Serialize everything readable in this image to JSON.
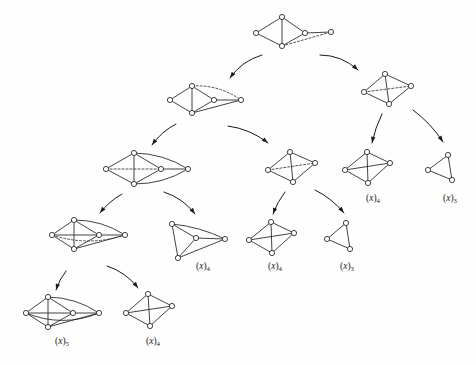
{
  "figure": {
    "width": 476,
    "height": 365,
    "background_color": "#fefefe",
    "ink_color": "#25211e",
    "node_fill": "#ffffff",
    "node_radius": 2.6,
    "bottom_caption": "",
    "graphs": [
      {
        "id": "g-root",
        "name": "root-graph",
        "vertices": 5,
        "label": "",
        "label_base": "",
        "label_sub": "",
        "nodes": [
          {
            "x": 282,
            "y": 17
          },
          {
            "x": 256,
            "y": 33
          },
          {
            "x": 282,
            "y": 46
          },
          {
            "x": 305,
            "y": 33
          },
          {
            "x": 331,
            "y": 32
          }
        ],
        "edges": [
          {
            "from": 0,
            "to": 1,
            "style": "solid"
          },
          {
            "from": 1,
            "to": 2,
            "style": "solid"
          },
          {
            "from": 0,
            "to": 2,
            "style": "solid"
          },
          {
            "from": 0,
            "to": 3,
            "style": "solid"
          },
          {
            "from": 2,
            "to": 3,
            "style": "solid"
          },
          {
            "from": 3,
            "to": 4,
            "style": "solid"
          },
          {
            "from": 2,
            "to": 4,
            "style": "dashed"
          }
        ],
        "arcs": []
      },
      {
        "id": "g-L1",
        "name": "level1-left-graph",
        "vertices": 5,
        "label": "",
        "label_base": "",
        "label_sub": "",
        "nodes": [
          {
            "x": 192,
            "y": 86
          },
          {
            "x": 170,
            "y": 100
          },
          {
            "x": 192,
            "y": 113
          },
          {
            "x": 214,
            "y": 100
          },
          {
            "x": 241,
            "y": 100
          }
        ],
        "edges": [
          {
            "from": 0,
            "to": 1,
            "style": "solid"
          },
          {
            "from": 1,
            "to": 2,
            "style": "solid"
          },
          {
            "from": 0,
            "to": 2,
            "style": "solid"
          },
          {
            "from": 0,
            "to": 3,
            "style": "solid"
          },
          {
            "from": 2,
            "to": 3,
            "style": "solid"
          },
          {
            "from": 3,
            "to": 4,
            "style": "solid"
          },
          {
            "from": 2,
            "to": 4,
            "style": "solid"
          }
        ],
        "arcs": [
          {
            "from": 0,
            "to": 4,
            "bow": -9,
            "style": "dashed"
          }
        ]
      },
      {
        "id": "g-R1",
        "name": "level1-right-graph",
        "vertices": 4,
        "label": "",
        "label_base": "",
        "label_sub": "",
        "nodes": [
          {
            "x": 385,
            "y": 74
          },
          {
            "x": 364,
            "y": 92
          },
          {
            "x": 389,
            "y": 104
          },
          {
            "x": 411,
            "y": 86
          }
        ],
        "edges": [
          {
            "from": 0,
            "to": 1,
            "style": "solid"
          },
          {
            "from": 1,
            "to": 2,
            "style": "solid"
          },
          {
            "from": 2,
            "to": 3,
            "style": "solid"
          },
          {
            "from": 0,
            "to": 3,
            "style": "solid"
          },
          {
            "from": 0,
            "to": 2,
            "style": "solid"
          },
          {
            "from": 1,
            "to": 3,
            "style": "dashed"
          }
        ],
        "arcs": []
      },
      {
        "id": "g-L2",
        "name": "level2-left-graph",
        "vertices": 5,
        "label": "",
        "label_base": "",
        "label_sub": "",
        "nodes": [
          {
            "x": 134,
            "y": 153
          },
          {
            "x": 106,
            "y": 169
          },
          {
            "x": 134,
            "y": 184
          },
          {
            "x": 161,
            "y": 169
          },
          {
            "x": 188,
            "y": 169
          }
        ],
        "edges": [
          {
            "from": 0,
            "to": 1,
            "style": "solid"
          },
          {
            "from": 1,
            "to": 2,
            "style": "solid"
          },
          {
            "from": 0,
            "to": 2,
            "style": "solid"
          },
          {
            "from": 0,
            "to": 3,
            "style": "solid"
          },
          {
            "from": 2,
            "to": 3,
            "style": "solid"
          },
          {
            "from": 3,
            "to": 4,
            "style": "solid"
          },
          {
            "from": 1,
            "to": 3,
            "style": "dashed"
          }
        ],
        "arcs": [
          {
            "from": 0,
            "to": 4,
            "bow": -8,
            "style": "solid"
          },
          {
            "from": 2,
            "to": 4,
            "bow": 8,
            "style": "solid"
          }
        ]
      },
      {
        "id": "g-M2",
        "name": "level2-mid-graph",
        "vertices": 4,
        "label": "",
        "label_base": "",
        "label_sub": "",
        "nodes": [
          {
            "x": 290,
            "y": 152
          },
          {
            "x": 268,
            "y": 170
          },
          {
            "x": 293,
            "y": 182
          },
          {
            "x": 315,
            "y": 163
          }
        ],
        "edges": [
          {
            "from": 0,
            "to": 1,
            "style": "solid"
          },
          {
            "from": 1,
            "to": 2,
            "style": "solid"
          },
          {
            "from": 2,
            "to": 3,
            "style": "solid"
          },
          {
            "from": 0,
            "to": 3,
            "style": "solid"
          },
          {
            "from": 0,
            "to": 2,
            "style": "solid"
          },
          {
            "from": 1,
            "to": 3,
            "style": "dashed"
          }
        ],
        "arcs": []
      },
      {
        "id": "g-R2",
        "name": "level2-k4-graph",
        "vertices": 4,
        "label": "(x)4",
        "label_base": "x",
        "label_sub": "4",
        "label_x": 366,
        "label_y": 201,
        "nodes": [
          {
            "x": 367,
            "y": 152
          },
          {
            "x": 345,
            "y": 170
          },
          {
            "x": 368,
            "y": 183
          },
          {
            "x": 390,
            "y": 163
          }
        ],
        "edges": [
          {
            "from": 0,
            "to": 1,
            "style": "solid"
          },
          {
            "from": 1,
            "to": 2,
            "style": "solid"
          },
          {
            "from": 2,
            "to": 3,
            "style": "solid"
          },
          {
            "from": 0,
            "to": 3,
            "style": "solid"
          },
          {
            "from": 0,
            "to": 2,
            "style": "solid"
          },
          {
            "from": 1,
            "to": 3,
            "style": "solid"
          }
        ],
        "arcs": []
      },
      {
        "id": "g-R3",
        "name": "level2-triangle-graph",
        "vertices": 3,
        "label": "(x)3",
        "label_base": "x",
        "label_sub": "3",
        "label_x": 443,
        "label_y": 201,
        "nodes": [
          {
            "x": 448,
            "y": 155
          },
          {
            "x": 428,
            "y": 170
          },
          {
            "x": 452,
            "y": 180
          }
        ],
        "edges": [
          {
            "from": 0,
            "to": 1,
            "style": "solid"
          },
          {
            "from": 1,
            "to": 2,
            "style": "solid"
          },
          {
            "from": 0,
            "to": 2,
            "style": "solid"
          }
        ],
        "arcs": []
      },
      {
        "id": "g-L3",
        "name": "level3-left-graph",
        "vertices": 5,
        "label": "",
        "label_base": "",
        "label_sub": "",
        "nodes": [
          {
            "x": 74,
            "y": 220
          },
          {
            "x": 52,
            "y": 235
          },
          {
            "x": 74,
            "y": 249
          },
          {
            "x": 99,
            "y": 235
          },
          {
            "x": 125,
            "y": 235
          }
        ],
        "edges": [
          {
            "from": 0,
            "to": 1,
            "style": "solid"
          },
          {
            "from": 1,
            "to": 2,
            "style": "solid"
          },
          {
            "from": 0,
            "to": 2,
            "style": "solid"
          },
          {
            "from": 0,
            "to": 3,
            "style": "solid"
          },
          {
            "from": 2,
            "to": 3,
            "style": "solid"
          },
          {
            "from": 3,
            "to": 4,
            "style": "solid"
          },
          {
            "from": 1,
            "to": 3,
            "style": "solid"
          },
          {
            "from": 2,
            "to": 4,
            "style": "solid"
          }
        ],
        "arcs": [
          {
            "from": 0,
            "to": 4,
            "bow": -8,
            "style": "solid"
          },
          {
            "from": 1,
            "to": 4,
            "bow": 12,
            "style": "dashed"
          }
        ]
      },
      {
        "id": "g-M3",
        "name": "level3-mid-k4-graph",
        "vertices": 4,
        "label": "(x)4",
        "label_base": "x",
        "label_sub": "4",
        "label_x": 196,
        "label_y": 269,
        "nodes": [
          {
            "x": 172,
            "y": 224
          },
          {
            "x": 196,
            "y": 238
          },
          {
            "x": 225,
            "y": 239
          },
          {
            "x": 178,
            "y": 258
          }
        ],
        "edges": [
          {
            "from": 0,
            "to": 1,
            "style": "solid"
          },
          {
            "from": 1,
            "to": 2,
            "style": "solid"
          },
          {
            "from": 0,
            "to": 3,
            "style": "solid"
          },
          {
            "from": 1,
            "to": 3,
            "style": "solid"
          },
          {
            "from": 2,
            "to": 3,
            "style": "solid"
          }
        ],
        "arcs": [
          {
            "from": 0,
            "to": 2,
            "bow": -5,
            "style": "solid"
          }
        ]
      },
      {
        "id": "g-M4",
        "name": "level3-k4-graph",
        "vertices": 4,
        "label": "(x)4",
        "label_base": "x",
        "label_sub": "4",
        "label_x": 268,
        "label_y": 269,
        "nodes": [
          {
            "x": 271,
            "y": 222
          },
          {
            "x": 249,
            "y": 240
          },
          {
            "x": 272,
            "y": 253
          },
          {
            "x": 294,
            "y": 233
          }
        ],
        "edges": [
          {
            "from": 0,
            "to": 1,
            "style": "solid"
          },
          {
            "from": 1,
            "to": 2,
            "style": "solid"
          },
          {
            "from": 2,
            "to": 3,
            "style": "solid"
          },
          {
            "from": 0,
            "to": 3,
            "style": "solid"
          },
          {
            "from": 0,
            "to": 2,
            "style": "solid"
          },
          {
            "from": 1,
            "to": 3,
            "style": "solid"
          }
        ],
        "arcs": []
      },
      {
        "id": "g-M5",
        "name": "level3-triangle-graph",
        "vertices": 3,
        "label": "(x)3",
        "label_base": "x",
        "label_sub": "3",
        "label_x": 340,
        "label_y": 269,
        "nodes": [
          {
            "x": 346,
            "y": 223
          },
          {
            "x": 327,
            "y": 239
          },
          {
            "x": 350,
            "y": 249
          }
        ],
        "edges": [
          {
            "from": 0,
            "to": 1,
            "style": "solid"
          },
          {
            "from": 1,
            "to": 2,
            "style": "solid"
          },
          {
            "from": 0,
            "to": 2,
            "style": "solid"
          }
        ],
        "arcs": []
      },
      {
        "id": "g-B1",
        "name": "bottom-left-graph",
        "vertices": 5,
        "label": "(x)5",
        "label_base": "x",
        "label_sub": "5",
        "label_x": 55,
        "label_y": 344,
        "nodes": [
          {
            "x": 48,
            "y": 297
          },
          {
            "x": 26,
            "y": 313
          },
          {
            "x": 48,
            "y": 327
          },
          {
            "x": 73,
            "y": 313
          },
          {
            "x": 99,
            "y": 313
          }
        ],
        "edges": [
          {
            "from": 0,
            "to": 1,
            "style": "solid"
          },
          {
            "from": 1,
            "to": 2,
            "style": "solid"
          },
          {
            "from": 0,
            "to": 2,
            "style": "solid"
          },
          {
            "from": 0,
            "to": 3,
            "style": "solid"
          },
          {
            "from": 2,
            "to": 3,
            "style": "solid"
          },
          {
            "from": 3,
            "to": 4,
            "style": "solid"
          },
          {
            "from": 1,
            "to": 3,
            "style": "solid"
          },
          {
            "from": 2,
            "to": 4,
            "style": "solid"
          }
        ],
        "arcs": [
          {
            "from": 0,
            "to": 4,
            "bow": -8,
            "style": "solid"
          },
          {
            "from": 1,
            "to": 4,
            "bow": 15,
            "style": "solid"
          }
        ]
      },
      {
        "id": "g-B2",
        "name": "bottom-k4-graph",
        "vertices": 4,
        "label": "(x)4",
        "label_base": "x",
        "label_sub": "4",
        "label_x": 146,
        "label_y": 344,
        "nodes": [
          {
            "x": 148,
            "y": 294
          },
          {
            "x": 126,
            "y": 313
          },
          {
            "x": 150,
            "y": 326
          },
          {
            "x": 172,
            "y": 306
          }
        ],
        "edges": [
          {
            "from": 0,
            "to": 1,
            "style": "solid"
          },
          {
            "from": 1,
            "to": 2,
            "style": "solid"
          },
          {
            "from": 2,
            "to": 3,
            "style": "solid"
          },
          {
            "from": 0,
            "to": 3,
            "style": "solid"
          },
          {
            "from": 0,
            "to": 2,
            "style": "solid"
          },
          {
            "from": 1,
            "to": 3,
            "style": "solid"
          }
        ],
        "arcs": []
      }
    ],
    "arrows": [
      {
        "name": "arrow-root-to-left",
        "x1": 262,
        "y1": 55,
        "x2": 230,
        "y2": 78,
        "bow": 7
      },
      {
        "name": "arrow-root-to-right",
        "x1": 320,
        "y1": 55,
        "x2": 358,
        "y2": 70,
        "bow": -8
      },
      {
        "name": "arrow-l1-to-l2",
        "x1": 176,
        "y1": 124,
        "x2": 152,
        "y2": 145,
        "bow": 4
      },
      {
        "name": "arrow-l1-to-m2",
        "x1": 228,
        "y1": 126,
        "x2": 268,
        "y2": 143,
        "bow": -6
      },
      {
        "name": "arrow-r1-to-k4",
        "x1": 382,
        "y1": 114,
        "x2": 372,
        "y2": 143,
        "bow": 2
      },
      {
        "name": "arrow-r1-to-tri",
        "x1": 413,
        "y1": 110,
        "x2": 443,
        "y2": 142,
        "bow": -4
      },
      {
        "name": "arrow-l2-to-l3",
        "x1": 122,
        "y1": 194,
        "x2": 100,
        "y2": 213,
        "bow": 3
      },
      {
        "name": "arrow-l2-to-m3",
        "x1": 164,
        "y1": 192,
        "x2": 195,
        "y2": 214,
        "bow": -6
      },
      {
        "name": "arrow-m2-to-k4",
        "x1": 285,
        "y1": 192,
        "x2": 273,
        "y2": 214,
        "bow": 2
      },
      {
        "name": "arrow-m2-to-tri",
        "x1": 315,
        "y1": 190,
        "x2": 344,
        "y2": 213,
        "bow": -4
      },
      {
        "name": "arrow-l3-to-b1",
        "x1": 66,
        "y1": 271,
        "x2": 56,
        "y2": 290,
        "bow": 2
      },
      {
        "name": "arrow-l3-to-b2",
        "x1": 107,
        "y1": 266,
        "x2": 138,
        "y2": 288,
        "bow": -6
      }
    ]
  }
}
